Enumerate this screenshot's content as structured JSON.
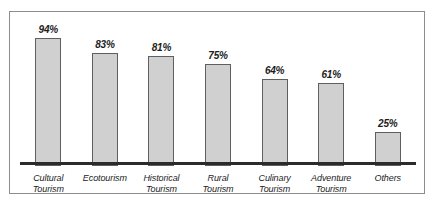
{
  "chart_data": {
    "type": "bar",
    "title": "",
    "subtitle": "",
    "xlabel": "",
    "ylabel": "",
    "ylim": [
      0,
      100
    ],
    "grid": false,
    "legend": "none",
    "categories": [
      "Cultural\nTourism",
      "Ecotourism",
      "Historical\nTourism",
      "Rural\nTourism",
      "Culinary\nTourism",
      "Adventure\nTourism",
      "Others"
    ],
    "values": [
      94,
      83,
      81,
      75,
      64,
      61,
      25
    ],
    "value_labels": [
      "94%",
      "83%",
      "81%",
      "75%",
      "64%",
      "61%",
      "25%"
    ],
    "colors": {
      "bar_fill": "#d0d0d0",
      "bar_border": "#5f5f5f",
      "axis_line": "#2b2b2b",
      "frame_border": "#8d8d8d",
      "background": "#ffffff",
      "text": "#1c1c1c"
    }
  }
}
